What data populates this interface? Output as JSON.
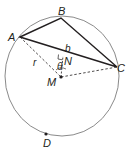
{
  "diagram": {
    "type": "geometry-circle-inscribed-triangle",
    "colors": {
      "circle": "#8a8a8a",
      "triangle": "#231f20",
      "dashed": "#231f20",
      "label": "#231f20"
    },
    "circle": {
      "center_label": "M",
      "cx": 62,
      "cy": 76,
      "rx": 57,
      "ry": 60
    },
    "points": {
      "A": {
        "label": "A",
        "x": 20,
        "y": 37
      },
      "B": {
        "label": "B",
        "x": 61,
        "y": 18
      },
      "C": {
        "label": "C",
        "x": 117,
        "y": 67
      },
      "M": {
        "label": "M",
        "x": 61,
        "y": 77
      },
      "N": {
        "label": "N",
        "x": 63,
        "y": 56
      },
      "D": {
        "label": "D",
        "x": 46,
        "y": 134
      }
    },
    "segment_labels": {
      "b": "b",
      "r": "r",
      "theta": "θ"
    }
  }
}
